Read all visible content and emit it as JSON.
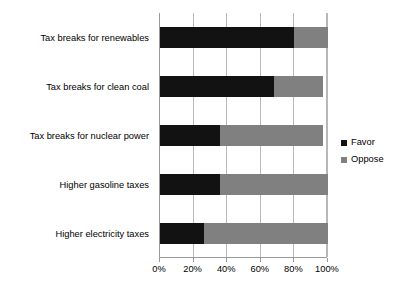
{
  "chart_data": {
    "type": "bar",
    "orientation": "horizontal",
    "stacked": true,
    "title": "",
    "xlabel": "",
    "ylabel": "",
    "xlim": [
      0,
      100
    ],
    "xticks": [
      0,
      20,
      40,
      60,
      80,
      100
    ],
    "xtick_labels": [
      "0%",
      "20%",
      "40%",
      "60%",
      "80%",
      "100%"
    ],
    "grid": true,
    "legend_position": "right",
    "categories": [
      "Tax breaks for renewables",
      "Tax breaks for clean coal",
      "Tax breaks for nuclear power",
      "Higher gasoline taxes",
      "Higher electricity taxes"
    ],
    "series": [
      {
        "name": "Favor",
        "color": "#121212",
        "values": [
          80,
          68,
          36,
          36,
          26
        ]
      },
      {
        "name": "Oppose",
        "color": "#808080",
        "values": [
          20,
          29,
          61,
          64,
          74
        ]
      }
    ]
  },
  "legend": {
    "items": [
      {
        "label": "Favor",
        "swatch": "favor-swatch"
      },
      {
        "label": "Oppose",
        "swatch": "oppose-swatch"
      }
    ]
  },
  "colors": {
    "favor": "#121212",
    "oppose": "#808080",
    "axis": "#9a9a9a",
    "grid": "#b8b8b8",
    "background": "#ffffff",
    "text": "#000000"
  }
}
